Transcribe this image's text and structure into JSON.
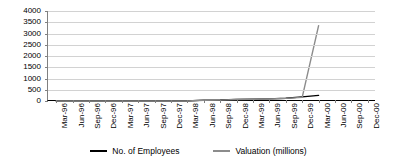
{
  "chart_data": {
    "type": "line",
    "title": "",
    "subtitle": "",
    "xlabel": "",
    "ylabel": "",
    "ylim": [
      0,
      4000
    ],
    "ytick_step": 500,
    "grid": true,
    "legend_position": "bottom",
    "categories": [
      "Mar-96",
      "Jun-96",
      "Sep-96",
      "Dec-96",
      "Mar-97",
      "Jun-97",
      "Sep-97",
      "Dec-97",
      "Mar-98",
      "Jun-98",
      "Sep-98",
      "Dec-98",
      "Mar-99",
      "Jun-99",
      "Sep-99",
      "Dec-99",
      "Mar-00",
      "Jun-00",
      "Sep-00",
      "Dec-00"
    ],
    "ytick_labels": [
      "4000",
      "3500",
      "3000",
      "2500",
      "2000",
      "1500",
      "1000",
      "500",
      "0"
    ],
    "series": [
      {
        "name": "No. of Employees",
        "color": "#000000",
        "values": [
          0,
          0,
          0,
          0,
          0,
          0,
          0,
          0,
          0,
          40,
          45,
          70,
          80,
          95,
          120,
          185,
          250,
          null,
          null,
          null
        ]
      },
      {
        "name": "Valuation (millions)",
        "color": "#8c8c8c",
        "values": [
          0,
          0,
          0,
          0,
          0,
          0,
          0,
          0,
          0,
          35,
          40,
          65,
          75,
          90,
          115,
          160,
          3350,
          null,
          null,
          null
        ]
      }
    ]
  },
  "legend": {
    "items": [
      {
        "label": "No. of Employees",
        "color": "#000000"
      },
      {
        "label": "Valuation (millions)",
        "color": "#8c8c8c"
      }
    ]
  }
}
